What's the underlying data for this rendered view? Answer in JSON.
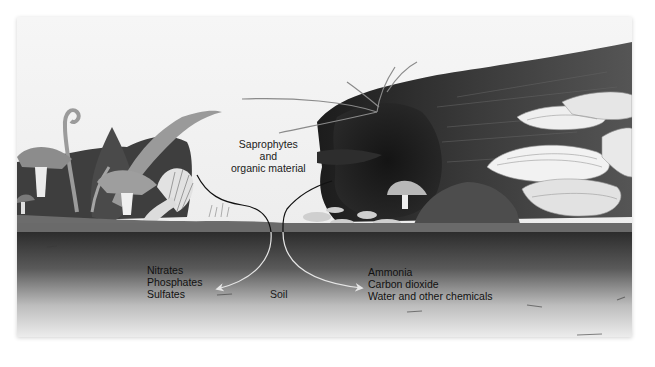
{
  "diagram": {
    "labels": {
      "source": {
        "lines": [
          "Saprophytes",
          "and",
          "organic material"
        ]
      },
      "left_products": {
        "lines": [
          "Nitrates",
          "Phosphates",
          "Sulfates"
        ]
      },
      "soil": "Soil",
      "right_products": {
        "lines": [
          "Ammonia",
          "Carbon dioxide",
          "Water and other chemicals"
        ]
      }
    },
    "arrows": [
      {
        "from": "source",
        "to": "left_products",
        "color_above_ground": "#111111",
        "color_below_ground": "#e6e6e6"
      },
      {
        "from": "source",
        "to": "right_products",
        "color_above_ground": "#111111",
        "color_below_ground": "#e6e6e6"
      }
    ],
    "colors": {
      "sky": "#f4f4f4",
      "ground_surface": "#6e6e6e",
      "soil_top": "#2e2e2e",
      "soil_bottom": "#e9e9e9",
      "log": "#2a2a2a",
      "shelf_fungi": "#e8e8e8",
      "foliage": "#555555"
    }
  }
}
